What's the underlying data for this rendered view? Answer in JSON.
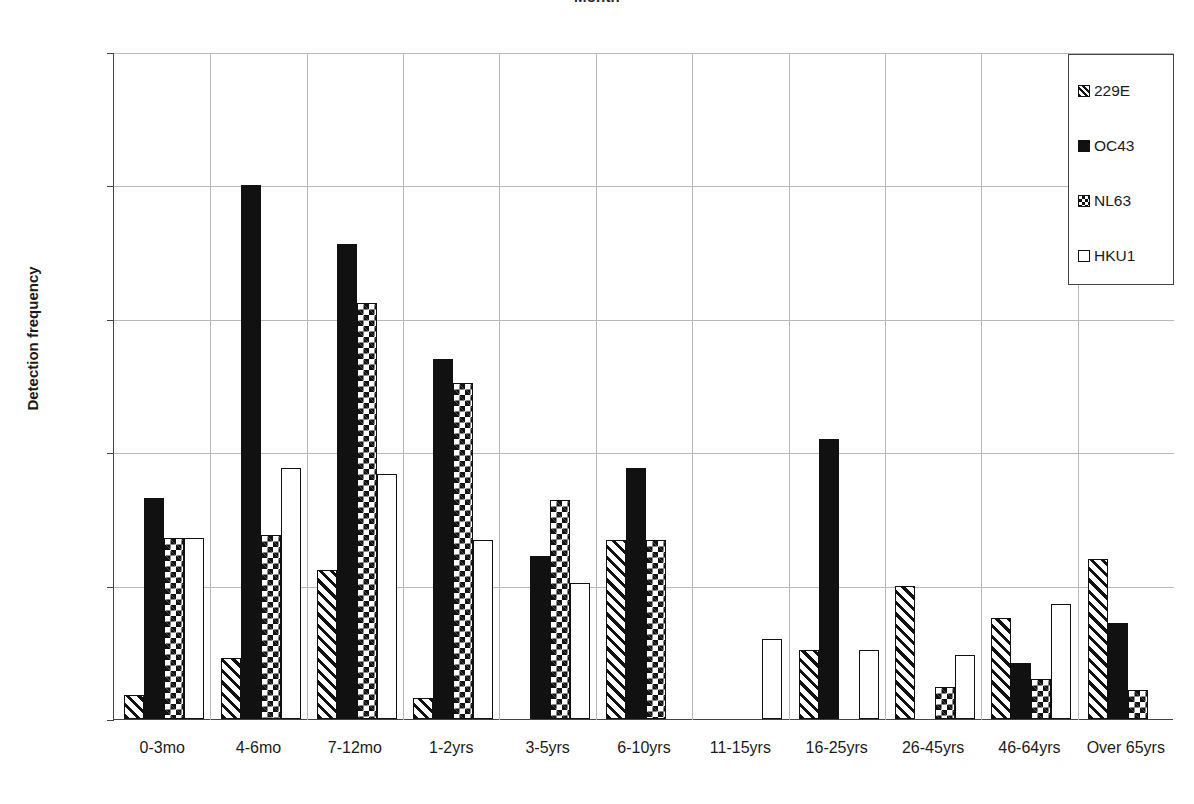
{
  "chart_data": {
    "type": "bar",
    "title": "Month",
    "subtitle": "",
    "xlabel": "",
    "ylabel": "Detection frequency",
    "ylim": [
      0,
      0.025
    ],
    "yticks": [
      0,
      0.005,
      0.01,
      0.015,
      0.02,
      0.025
    ],
    "ytick_labels": [
      "0",
      "0.005",
      "0.01",
      "0.015",
      "0.02",
      "0.025"
    ],
    "grid": true,
    "legend_position": "top-right",
    "categories": [
      "0-3mo",
      "4-6mo",
      "7-12mo",
      "1-2yrs",
      "3-5yrs",
      "6-10yrs",
      "11-15yrs",
      "16-25yrs",
      "26-45yrs",
      "46-64yrs",
      "Over 65yrs"
    ],
    "series": [
      {
        "name": "229E",
        "pattern": "diagonal-hatch",
        "values": [
          0.0009,
          0.0023,
          0.0056,
          0.0008,
          0,
          0.0067,
          0,
          0.0026,
          0.005,
          0.0038,
          0.006
        ]
      },
      {
        "name": "OC43",
        "pattern": "solid-black",
        "values": [
          0.0083,
          0.02,
          0.0178,
          0.0135,
          0.0061,
          0.0094,
          0,
          0.0105,
          0,
          0.0021,
          0.0036
        ]
      },
      {
        "name": "NL63",
        "pattern": "checkered",
        "values": [
          0.0068,
          0.0069,
          0.0156,
          0.0126,
          0.0082,
          0.0067,
          0,
          0,
          0.0012,
          0.0015,
          0.0011
        ]
      },
      {
        "name": "HKU1",
        "pattern": "white-empty",
        "values": [
          0.0068,
          0.0094,
          0.0092,
          0.0067,
          0.0051,
          0,
          0.003,
          0.0026,
          0.0024,
          0.0043,
          0
        ]
      }
    ]
  },
  "legend": {
    "items": [
      {
        "label": "229E",
        "swatch": "hatch-swatch-icon"
      },
      {
        "label": "OC43",
        "swatch": "solid-swatch-icon"
      },
      {
        "label": "NL63",
        "swatch": "checker-swatch-icon"
      },
      {
        "label": "HKU1",
        "swatch": "empty-swatch-icon"
      }
    ]
  }
}
